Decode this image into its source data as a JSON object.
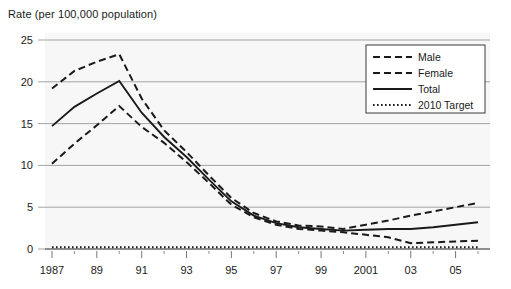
{
  "chart_data": {
    "type": "line",
    "title": "Rate (per 100,000 population)",
    "ylabel": "Rate (per 100,000 population)",
    "xlabel": "",
    "ylim": [
      0,
      25
    ],
    "yticks": [
      0,
      5,
      10,
      15,
      20,
      25
    ],
    "ytick_labels": [
      "0",
      "5",
      "10",
      "15",
      "20",
      "25"
    ],
    "x": [
      1987,
      1988,
      1989,
      1990,
      1991,
      1992,
      1993,
      1994,
      1995,
      1996,
      1997,
      1998,
      1999,
      2000,
      2001,
      2002,
      2003,
      2004,
      2005,
      2006
    ],
    "xticks_major": [
      1987,
      1989,
      1991,
      1993,
      1995,
      1997,
      1999,
      2001,
      2003,
      2005
    ],
    "xtick_labels": [
      "1987",
      "89",
      "91",
      "93",
      "95",
      "97",
      "99",
      "2001",
      "03",
      "05"
    ],
    "grid": true,
    "grid_axis": "y",
    "legend_position": "upper-right",
    "series": [
      {
        "name": "Male",
        "style": "dashed",
        "color": "#1a1a1a",
        "values": [
          19.2,
          21.3,
          22.4,
          23.3,
          18.0,
          14.2,
          11.6,
          8.8,
          6.1,
          4.3,
          3.3,
          2.8,
          2.7,
          2.4,
          2.9,
          3.4,
          4.0,
          4.5,
          5.0,
          5.5
        ]
      },
      {
        "name": "Female",
        "style": "dashed",
        "color": "#1a1a1a",
        "values": [
          10.2,
          12.6,
          14.8,
          17.1,
          14.6,
          12.7,
          10.4,
          7.9,
          5.3,
          3.8,
          2.9,
          2.4,
          2.2,
          2.0,
          1.7,
          1.4,
          0.7,
          0.8,
          0.9,
          1.0
        ]
      },
      {
        "name": "Total",
        "style": "solid",
        "color": "#1a1a1a",
        "values": [
          14.7,
          17.0,
          18.6,
          20.1,
          16.3,
          13.4,
          11.0,
          8.3,
          5.7,
          4.0,
          3.1,
          2.6,
          2.4,
          2.2,
          2.3,
          2.4,
          2.4,
          2.6,
          2.9,
          3.2
        ]
      },
      {
        "name": "2010 Target",
        "style": "dotted",
        "color": "#1a1a1a",
        "values": [
          0.2,
          0.2,
          0.2,
          0.2,
          0.2,
          0.2,
          0.2,
          0.2,
          0.2,
          0.2,
          0.2,
          0.2,
          0.2,
          0.2,
          0.2,
          0.2,
          0.2,
          0.2,
          0.2,
          0.2
        ]
      }
    ],
    "legend_entries": [
      {
        "label": "Male",
        "style": "dashed"
      },
      {
        "label": "Female",
        "style": "dashed"
      },
      {
        "label": "Total",
        "style": "solid"
      },
      {
        "label": "2010 Target",
        "style": "dotted"
      }
    ]
  },
  "colors": {
    "ink": "#1a1a1a",
    "grid": "#9a9a9a",
    "plot_bg": "#f7f7f7",
    "page_bg": "#ffffff"
  }
}
